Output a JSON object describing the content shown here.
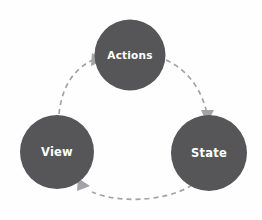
{
  "diagram": {
    "background_color": "#fefefe",
    "node_fill_color": "#565659",
    "node_label_color": "#ffffff",
    "arrow_color": "#a3a3a6",
    "nodes": [
      {
        "id": "actions",
        "label": "Actions",
        "cx": 130,
        "cy": 55,
        "r": 35.5,
        "font_size": 10.5
      },
      {
        "id": "view",
        "label": "View",
        "cx": 57,
        "cy": 152,
        "r": 37,
        "font_size": 11.5
      },
      {
        "id": "state",
        "label": "State",
        "cx": 209,
        "cy": 153,
        "r": 38,
        "font_size": 11.5
      }
    ],
    "edges": [
      {
        "id": "view-to-actions",
        "from": "view",
        "to": "actions",
        "style": "dashed",
        "dash_pattern": "5 4",
        "stroke_width": 1.7,
        "path": "M 59 114 C 62 86 74 68 95 59",
        "arrow_points": "92,53 104,60 91,66"
      },
      {
        "id": "actions-to-state",
        "from": "actions",
        "to": "state",
        "style": "dashed",
        "dash_pattern": "5 4",
        "stroke_width": 1.7,
        "path": "M 166 60 C 188 70 202 90 207 114",
        "arrow_points": "201,110 214,110 207,123"
      },
      {
        "id": "state-to-view",
        "from": "state",
        "to": "view",
        "style": "dashed",
        "dash_pattern": "5 4",
        "stroke_width": 1.7,
        "path": "M 192 185 C 168 201 120 204 92 192"
      },
      {
        "id": "state-to-view-arrowhead",
        "arrow_points": "78,178 90,186 77,191"
      }
    ]
  }
}
